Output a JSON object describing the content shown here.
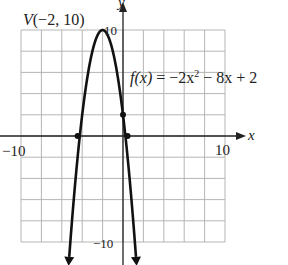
{
  "chart_data": {
    "type": "line",
    "title": "",
    "function": "f(x) = -2x^2 - 8x + 2",
    "function_label": {
      "fx": "f(x)",
      "rhs": " = −2x",
      "exp": "2",
      "tail": " − 8x + 2"
    },
    "vertex": {
      "x": -2,
      "y": 10,
      "label": "V(−2, 10)"
    },
    "marked_points": [
      {
        "x": -4.449,
        "y": 0
      },
      {
        "x": 0.449,
        "y": 0
      },
      {
        "x": 0,
        "y": 2
      }
    ],
    "xlabel": "x",
    "ylabel": "y",
    "xlim": [
      -10,
      10
    ],
    "ylim": [
      -10,
      10
    ],
    "grid": true,
    "grid_step": 2,
    "tick_labels": {
      "x_min": "−10",
      "x_max": "10",
      "y_max": "10",
      "y_min": "−10"
    },
    "colors": {
      "curve": "#111111",
      "grid": "#b5b5b5",
      "axis": "#222222"
    }
  }
}
